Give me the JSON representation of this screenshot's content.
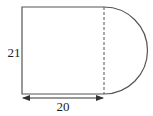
{
  "diagram": {
    "labels": {
      "height": "21",
      "width": "20"
    },
    "colors": {
      "stroke": "#555555",
      "text": "#222222",
      "background": "#ffffff"
    }
  }
}
